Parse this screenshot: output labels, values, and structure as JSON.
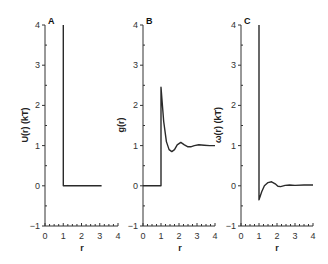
{
  "chart_data": [
    {
      "type": "line",
      "panel": "A",
      "title": "",
      "xlabel": "r",
      "ylabel": "U(r) (kT)",
      "xlim": [
        0,
        4
      ],
      "ylim": [
        -1,
        4
      ],
      "xticks": [
        "0",
        "1",
        "2",
        "3",
        "4"
      ],
      "yticks": [
        "-1",
        "0",
        "1",
        "2",
        "3",
        "4"
      ],
      "grid": false,
      "series": [
        {
          "name": "U(r)",
          "x": [
            1,
            1,
            3.1
          ],
          "y": [
            4,
            0,
            0
          ]
        }
      ]
    },
    {
      "type": "line",
      "panel": "B",
      "title": "",
      "xlabel": "r",
      "ylabel": "g(r)",
      "xlim": [
        0,
        4
      ],
      "ylim": [
        -1,
        4
      ],
      "xticks": [
        "0",
        "1",
        "2",
        "3",
        "4"
      ],
      "yticks": [
        "-1",
        "0",
        "1",
        "2",
        "3",
        "4"
      ],
      "grid": false,
      "series": [
        {
          "name": "g(r)",
          "x": [
            0,
            1,
            1,
            1.15,
            1.3,
            1.45,
            1.6,
            1.75,
            1.9,
            2.1,
            2.3,
            2.5,
            2.65,
            2.85,
            3.1,
            3.4,
            3.7,
            4.0
          ],
          "y": [
            0,
            0,
            2.45,
            1.6,
            1.1,
            0.9,
            0.85,
            0.9,
            1.02,
            1.08,
            1.02,
            0.97,
            0.97,
            1.0,
            1.02,
            1.01,
            1.0,
            1.0
          ]
        }
      ]
    },
    {
      "type": "line",
      "panel": "C",
      "title": "",
      "xlabel": "r",
      "ylabel": "ω(r) (kT)",
      "xlim": [
        0,
        4
      ],
      "ylim": [
        -1,
        4
      ],
      "xticks": [
        "0",
        "1",
        "2",
        "3",
        "4"
      ],
      "yticks": [
        "-1",
        "0",
        "1",
        "2",
        "3",
        "4"
      ],
      "grid": false,
      "series": [
        {
          "name": "ω(r)",
          "x": [
            1,
            1,
            1.15,
            1.3,
            1.5,
            1.7,
            1.9,
            2.05,
            2.2,
            2.45,
            2.7,
            3.0,
            3.5,
            4.0
          ],
          "y": [
            4,
            -0.35,
            -0.15,
            0.0,
            0.08,
            0.1,
            0.05,
            -0.01,
            -0.02,
            0.01,
            0.02,
            0.01,
            0.02,
            0.02
          ]
        }
      ]
    }
  ],
  "panels": {
    "a": {
      "label": "A",
      "ylabel": "U(r) (kT)",
      "xlabel": "r"
    },
    "b": {
      "label": "B",
      "ylabel": "g(r)",
      "xlabel": "r"
    },
    "c": {
      "label": "C",
      "ylabel": "ω(r) (kT)",
      "xlabel": "r"
    }
  },
  "ticks": {
    "y": [
      "−1",
      "0",
      "1",
      "2",
      "3",
      "4"
    ],
    "x": [
      "0",
      "1",
      "2",
      "3",
      "4"
    ]
  },
  "colors": {
    "line": "#2a2a2a",
    "axis": "#333333"
  }
}
